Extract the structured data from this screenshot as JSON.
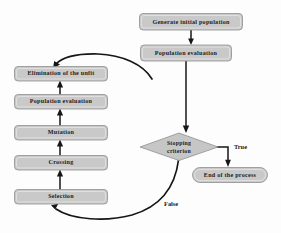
{
  "diagram": {
    "background_color": "#fdfdfd",
    "node_fill_color": "#c9c9c9",
    "node_border_color": "#8f8f8f",
    "line_color": "#161616",
    "nodes": {
      "generate_initial_population": "Generate initial population",
      "population_evaluation_top": "Population evaluation",
      "stopping_criterion_line1": "Stopping",
      "stopping_criterion_line2": "criterion",
      "end_of_process": "End of the process",
      "elimination_of_the_unfit": "Elimination of the unfit",
      "population_evaluation_left": "Population evaluation",
      "mutation": "Mutation",
      "crossing": "Crossing",
      "selection": "Selection"
    },
    "edge_labels": {
      "true_branch": "True",
      "false_branch": "False"
    }
  }
}
